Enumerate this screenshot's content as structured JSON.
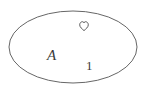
{
  "figure": {
    "background_color": "#ffffff",
    "width": 149,
    "height": 96
  },
  "shapes": {
    "boundary": {
      "kind": "ellipse",
      "name": "set-boundary-ellipse",
      "center_x": 73,
      "center_y": 47,
      "radius_x": 64,
      "radius_y": 36,
      "stroke_color": "#555555",
      "stroke_width": 0.9,
      "fill": "none"
    }
  },
  "elements": [
    {
      "id": "heart",
      "name": "heart-icon",
      "symbol": "♡",
      "label": "heart",
      "x": 84,
      "y": 26,
      "color": "#4a4a4a"
    },
    {
      "id": "set-label",
      "name": "set-label-A",
      "symbol": "A",
      "label": "A",
      "x": 53,
      "y": 56,
      "color": "#3a3a3a"
    },
    {
      "id": "one",
      "name": "element-one",
      "symbol": "1",
      "label": "1",
      "x": 90,
      "y": 66,
      "color": "#3a3a3a"
    }
  ],
  "labels": {
    "set_name": "A",
    "member_numeral": "1",
    "member_heart": "♡"
  }
}
